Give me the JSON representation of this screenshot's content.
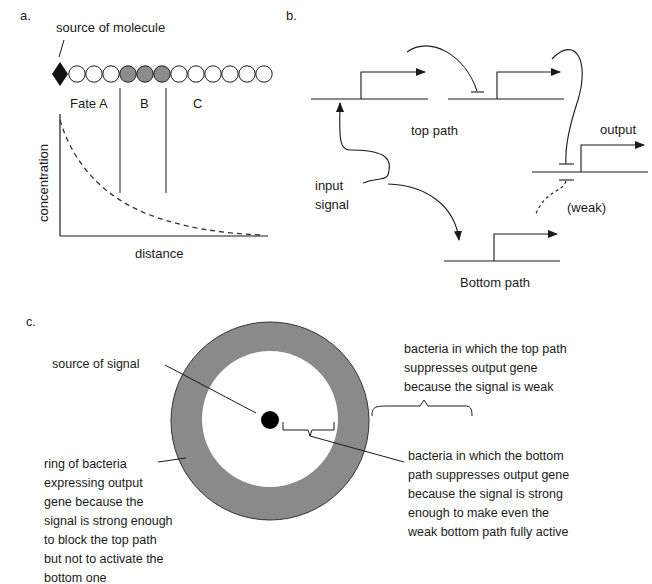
{
  "panel_a": {
    "label": "a.",
    "source_label": "source of molecule",
    "fates": {
      "a": "Fate A",
      "b": "B",
      "c": "C"
    },
    "cells": {
      "count_white_before": 3,
      "count_gray": 3,
      "count_white_after": 6
    },
    "y_axis_label": "concentration",
    "x_axis_label": "distance",
    "curve_style": "dashed exponential decay"
  },
  "panel_b": {
    "label": "b.",
    "top_path_label": "top path",
    "bottom_path_label": "Bottom path",
    "input_label_line1": "input",
    "input_label_line2": "signal",
    "output_label": "output",
    "weak_label": "(weak)"
  },
  "panel_c": {
    "label": "c.",
    "source_label": "source of signal",
    "top_right_lines": [
      "bacteria in which the top path",
      "suppresses output gene",
      "because the signal is weak"
    ],
    "bottom_right_lines": [
      "bacteria in which the bottom",
      "path suppresses output gene",
      "because the signal is strong",
      "enough to make even the",
      "weak bottom path fully active"
    ],
    "left_lines": [
      "ring of bacteria",
      "expressing output",
      "gene because the",
      "signal is strong enough",
      "to block the top path",
      "but not to activate the",
      "bottom one"
    ],
    "ring_color": "#8a8a8a"
  }
}
